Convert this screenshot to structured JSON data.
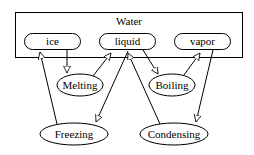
{
  "cluster": {
    "label": "Water"
  },
  "states": {
    "ice": "ice",
    "liquid": "liquid",
    "vapor": "vapor"
  },
  "processes": {
    "melting": "Melting",
    "boiling": "Boiling",
    "freezing": "Freezing",
    "condensing": "Condensing"
  },
  "edges": [
    {
      "from": "ice",
      "to": "Melting"
    },
    {
      "from": "Melting",
      "to": "liquid"
    },
    {
      "from": "liquid",
      "to": "Freezing"
    },
    {
      "from": "Freezing",
      "to": "ice"
    },
    {
      "from": "liquid",
      "to": "Boiling"
    },
    {
      "from": "Boiling",
      "to": "vapor"
    },
    {
      "from": "vapor",
      "to": "Condensing"
    },
    {
      "from": "Condensing",
      "to": "liquid"
    }
  ]
}
